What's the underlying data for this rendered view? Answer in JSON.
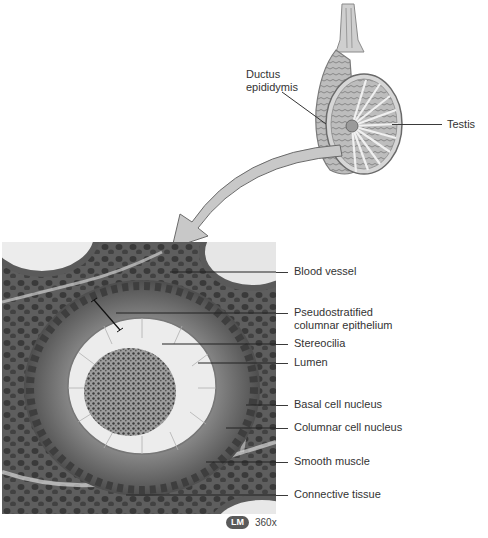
{
  "figure": {
    "gross_diagram": {
      "labels": [
        {
          "id": "ductus",
          "text_line1": "Ductus",
          "text_line2": "epididymis"
        },
        {
          "id": "testis",
          "text": "Testis"
        }
      ]
    },
    "micrograph": {
      "labels": [
        {
          "id": "blood-vessel",
          "text": "Blood vessel"
        },
        {
          "id": "pseudostratified",
          "text_line1": "Pseudostratified",
          "text_line2": "columnar epithelium"
        },
        {
          "id": "stereocilia",
          "text": "Stereocilia"
        },
        {
          "id": "lumen",
          "text": "Lumen"
        },
        {
          "id": "basal-nucleus",
          "text": "Basal cell nucleus"
        },
        {
          "id": "columnar-nucleus",
          "text": "Columnar cell nucleus"
        },
        {
          "id": "smooth-muscle",
          "text": "Smooth muscle"
        },
        {
          "id": "connective-tissue",
          "text": "Connective tissue"
        }
      ],
      "badge": "LM",
      "magnification": "360x"
    },
    "colors": {
      "background": "#ffffff",
      "arrow_fill": "#c8c8c8",
      "arrow_stroke": "#6a6a6a",
      "tissue_dark": "#4a4a4a",
      "lumen": "#ececec"
    }
  }
}
